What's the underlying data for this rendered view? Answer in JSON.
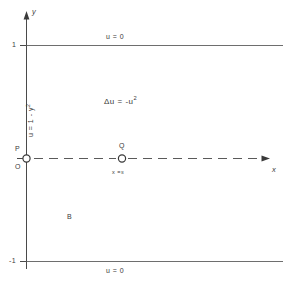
{
  "figure": {
    "type": "math-domain-diagram",
    "axes": {
      "x_label": "x",
      "y_label": "y",
      "y_ticks": [
        {
          "label": "1",
          "value": 1
        },
        {
          "label": "-1",
          "value": -1
        }
      ],
      "origin_label": "O"
    },
    "boundary_labels": {
      "top": "u = 0",
      "bottom": "u = 0",
      "left_prefix": "u = 1 - y",
      "left_exponent": "2"
    },
    "interior": {
      "pde_prefix": "Δu = -u",
      "pde_exponent": "2",
      "region_label": "B"
    },
    "points": [
      {
        "name": "P",
        "label": "P",
        "sublabel": "",
        "x": 0,
        "y": 0
      },
      {
        "name": "Q",
        "label": "Q",
        "sublabel_prefix": "x =",
        "sublabel_value": "s",
        "x": "s",
        "y": 0
      }
    ],
    "ray": {
      "style": "dashed",
      "from": "P",
      "direction": "positive-x"
    }
  }
}
